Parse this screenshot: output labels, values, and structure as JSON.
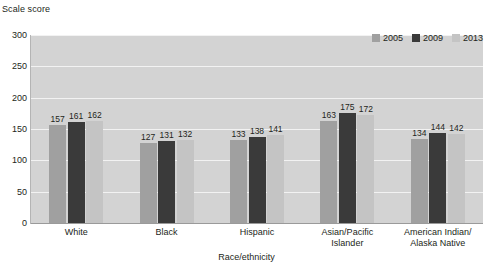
{
  "chart_data": {
    "type": "bar",
    "title": "",
    "ylabel": "Scale score",
    "xlabel": "Race/ethnicity",
    "categories": [
      "White",
      "Black",
      "Hispanic",
      "Asian/Pacific\nIslander",
      "American Indian/\nAlaska Native"
    ],
    "series": [
      {
        "name": "2005",
        "color": "#a0a0a0",
        "values": [
          157,
          127,
          133,
          163,
          134
        ]
      },
      {
        "name": "2009",
        "color": "#3a3a3a",
        "values": [
          161,
          131,
          138,
          175,
          144
        ]
      },
      {
        "name": "2013",
        "color": "#c4c4c4",
        "values": [
          162,
          132,
          141,
          172,
          142
        ]
      }
    ],
    "ylim": [
      0,
      300
    ],
    "yticks": [
      0,
      50,
      100,
      150,
      200,
      250,
      300
    ],
    "ytick_labels": [
      "0",
      "50",
      "100",
      "150",
      "200",
      "250",
      "300"
    ],
    "grid": true,
    "legend_position": "top-right",
    "plot_background": "#d3d3d3",
    "gridline_color": "#f2f2f2"
  }
}
